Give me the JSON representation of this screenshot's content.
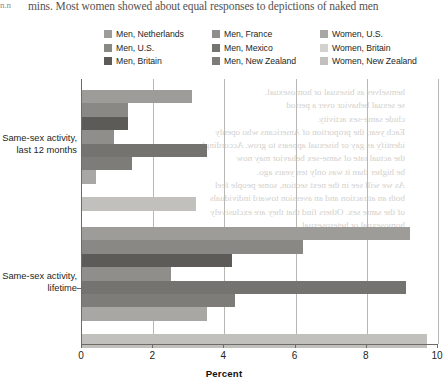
{
  "page": {
    "folio": "n.n",
    "running_text": "mins. Most women showed about equal responses to depictions of naked men"
  },
  "ghost_text": {
    "note": "faint mirrored show-through from the reverse side of the printed page",
    "lines_right": [
      "hemselves as bisexual or homosexual.",
      "se sexual behavior over a period",
      "clude same-sex activity.",
      "Each year, the proportion of Americans who openly",
      "identify as gay or bisexual appears to grow. Accordingly,",
      "the actual rate of same-sex behavior may now",
      "be higher than it was only ten years ago.",
      "As we will see in the next section, some people feel",
      "both an attraction and an aversion toward individuals",
      "of the same sex. Others find that they are exclusively",
      "homosexual or heterosexual."
    ]
  },
  "legend": {
    "items": [
      {
        "label": "Men, Netherlands",
        "color": "#9e9c99",
        "name": "men-netherlands"
      },
      {
        "label": "Men, France",
        "color": "#908e8b",
        "name": "men-france"
      },
      {
        "label": "Women, U.S.",
        "color": "#a9a7a4",
        "name": "women-us"
      },
      {
        "label": "Men, U.S.",
        "color": "#8a8885",
        "name": "men-us"
      },
      {
        "label": "Men, Mexico",
        "color": "#757370",
        "name": "men-mexico"
      },
      {
        "label": "Women, Britain",
        "color": "#d4d2cf",
        "name": "women-britain"
      },
      {
        "label": "Men, Britain",
        "color": "#5d5b58",
        "name": "men-britain"
      },
      {
        "label": "Men, New Zealand",
        "color": "#7e7c79",
        "name": "men-new-zealand"
      },
      {
        "label": "Women, New Zealand",
        "color": "#c2c0bd",
        "name": "women-new-zealand"
      }
    ]
  },
  "chart_data": {
    "type": "bar",
    "orientation": "horizontal",
    "title": "",
    "xlabel": "Percent",
    "ylabel": "",
    "xlim": [
      0,
      10
    ],
    "xticks": [
      0,
      2,
      4,
      6,
      8,
      10
    ],
    "xticklabels": [
      "0",
      "2",
      "4",
      "6",
      "8",
      "10"
    ],
    "grid": "vertical",
    "legend_position": "top",
    "categories": [
      "Same-sex activity,\nlast 12 months",
      "Same-sex activity,\nlifetime"
    ],
    "category_labels": [
      {
        "line1": "Same-sex activity,",
        "line2": "last 12 months"
      },
      {
        "line1": "Same-sex activity,",
        "line2": "lifetime"
      }
    ],
    "series": [
      {
        "name": "Men, Netherlands",
        "color": "#9e9c99",
        "values": [
          3.1,
          9.2
        ]
      },
      {
        "name": "Men, U.S.",
        "color": "#8a8885",
        "values": [
          1.3,
          6.2
        ]
      },
      {
        "name": "Men, Britain",
        "color": "#5d5b58",
        "values": [
          1.3,
          4.2
        ]
      },
      {
        "name": "Men, France",
        "color": "#908e8b",
        "values": [
          0.9,
          2.5
        ]
      },
      {
        "name": "Men, Mexico",
        "color": "#757370",
        "values": [
          3.5,
          9.1
        ]
      },
      {
        "name": "Men, New Zealand",
        "color": "#7e7c79",
        "values": [
          1.4,
          4.3
        ]
      },
      {
        "name": "Women, U.S.",
        "color": "#a9a7a4",
        "values": [
          0.4,
          3.5
        ]
      },
      {
        "name": "Women, Britain",
        "color": "#d4d2cf",
        "values": [
          0.0,
          0.0
        ]
      },
      {
        "name": "Women, New Zealand",
        "color": "#c2c0bd",
        "values": [
          3.2,
          9.7
        ]
      }
    ]
  }
}
